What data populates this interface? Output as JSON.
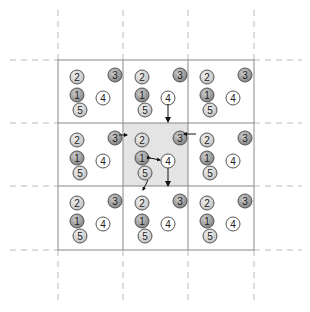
{
  "diagram": {
    "grid": {
      "cols": [
        58,
        123,
        188,
        254
      ],
      "rows": [
        60,
        123,
        186,
        250
      ],
      "highlight_cell": {
        "row": 1,
        "col": 1,
        "color": "#e4e4e4"
      }
    },
    "node_layout": {
      "2": {
        "dx": 12,
        "dy": 10,
        "style": "light",
        "label": "2"
      },
      "3": {
        "dx": 50,
        "dy": 8,
        "style": "dark",
        "label": "3"
      },
      "1": {
        "dx": 12,
        "dy": 28,
        "style": "dark",
        "label": "1"
      },
      "4": {
        "dx": 38,
        "dy": 31,
        "style": "white",
        "label": "4"
      },
      "5": {
        "dx": 15,
        "dy": 43,
        "style": "light",
        "label": "5"
      }
    },
    "arrows": [
      {
        "from": "top-center cell node 4",
        "to": "center cell top edge",
        "x1": 168,
        "y1": 125,
        "x2": 168,
        "y2": 126,
        "direction": "down"
      },
      {
        "from": "left-center cell node 3",
        "to": "center cell node 2"
      },
      {
        "from": "right-center cell node 2",
        "to": "center cell node 3"
      },
      {
        "from": "center cell node 1",
        "to": "center cell node 4",
        "bidirectional": true
      },
      {
        "from": "center cell node 4",
        "to": "bottom edge",
        "direction": "down"
      },
      {
        "from": "center cell node 5",
        "to": "bottom-center cell node 2"
      }
    ]
  }
}
